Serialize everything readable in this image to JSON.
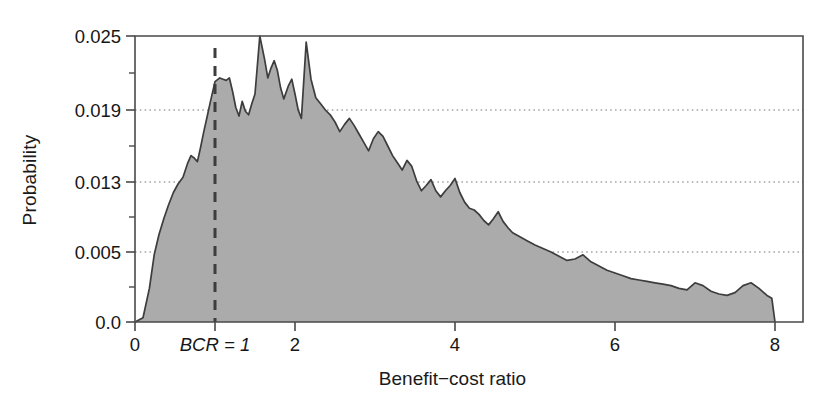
{
  "chart_data": {
    "type": "area",
    "title": "",
    "xlabel": "Benefit−cost ratio",
    "ylabel": "Probability",
    "xlim": [
      0,
      8.35
    ],
    "ylim": [
      0,
      0.0259
    ],
    "grid": "horizontal-dotted",
    "legend": "none",
    "fill_color": "#ababab",
    "line_color": "#3d3d3d",
    "xticks": [
      0,
      1,
      2,
      4,
      6,
      8
    ],
    "xticklabels": [
      "0",
      "BCR = 1",
      "2",
      "4",
      "6",
      "8"
    ],
    "yticks": [
      0.0,
      0.005,
      0.013,
      0.019,
      0.025
    ],
    "yticklabels": [
      "0.0",
      "0.005",
      "0.013",
      "0.019",
      "0.025"
    ],
    "yticks_minor": [
      0.0025,
      0.009,
      0.016,
      0.022
    ],
    "gridlines": [
      0.005,
      0.013,
      0.019
    ],
    "annotations": [
      {
        "name": "bcr-reference-line",
        "label": "BCR = 1",
        "x": 1.0,
        "style": "dashed-vertical",
        "color": "#3d3d3d"
      }
    ],
    "series": [
      {
        "name": "Benefit-cost ratio probability density",
        "x": [
          0.0,
          0.1,
          0.18,
          0.24,
          0.3,
          0.36,
          0.42,
          0.48,
          0.54,
          0.6,
          0.66,
          0.7,
          0.74,
          0.78,
          0.82,
          0.86,
          0.9,
          0.94,
          1.0,
          1.06,
          1.1,
          1.14,
          1.18,
          1.22,
          1.26,
          1.3,
          1.34,
          1.38,
          1.42,
          1.46,
          1.5,
          1.56,
          1.62,
          1.66,
          1.7,
          1.74,
          1.78,
          1.82,
          1.86,
          1.92,
          1.96,
          2.0,
          2.04,
          2.08,
          2.14,
          2.2,
          2.26,
          2.32,
          2.38,
          2.44,
          2.5,
          2.56,
          2.62,
          2.68,
          2.74,
          2.8,
          2.86,
          2.92,
          2.98,
          3.04,
          3.1,
          3.16,
          3.22,
          3.28,
          3.34,
          3.4,
          3.46,
          3.52,
          3.58,
          3.64,
          3.7,
          3.76,
          3.82,
          3.88,
          3.94,
          4.0,
          4.06,
          4.12,
          4.18,
          4.24,
          4.3,
          4.36,
          4.42,
          4.48,
          4.54,
          4.6,
          4.66,
          4.72,
          4.8,
          4.9,
          5.0,
          5.1,
          5.2,
          5.3,
          5.4,
          5.5,
          5.6,
          5.7,
          5.8,
          5.9,
          6.0,
          6.1,
          6.2,
          6.3,
          6.4,
          6.5,
          6.6,
          6.7,
          6.8,
          6.9,
          7.0,
          7.1,
          7.2,
          7.3,
          7.4,
          7.5,
          7.6,
          7.7,
          7.8,
          7.9,
          7.96,
          8.0
        ],
        "y": [
          0.0,
          0.0003,
          0.0024,
          0.0048,
          0.007,
          0.0088,
          0.0104,
          0.0118,
          0.0128,
          0.0134,
          0.0146,
          0.0152,
          0.015,
          0.0147,
          0.0159,
          0.0172,
          0.0184,
          0.0196,
          0.0213,
          0.0216,
          0.0215,
          0.0214,
          0.0216,
          0.0205,
          0.0192,
          0.0185,
          0.0197,
          0.0189,
          0.0186,
          0.0195,
          0.0203,
          0.025,
          0.0231,
          0.0216,
          0.0224,
          0.023,
          0.0222,
          0.0208,
          0.0199,
          0.021,
          0.0215,
          0.0203,
          0.019,
          0.0183,
          0.0245,
          0.0215,
          0.02,
          0.0195,
          0.019,
          0.0186,
          0.018,
          0.0172,
          0.0178,
          0.0183,
          0.0177,
          0.017,
          0.0163,
          0.0156,
          0.0166,
          0.0172,
          0.0168,
          0.016,
          0.0152,
          0.0146,
          0.014,
          0.0148,
          0.0143,
          0.0131,
          0.012,
          0.0126,
          0.0132,
          0.012,
          0.0113,
          0.012,
          0.0126,
          0.0133,
          0.0118,
          0.0107,
          0.01,
          0.0098,
          0.0093,
          0.0086,
          0.0081,
          0.0088,
          0.0096,
          0.0085,
          0.0078,
          0.0072,
          0.0068,
          0.0063,
          0.0058,
          0.0054,
          0.005,
          0.0047,
          0.0044,
          0.0045,
          0.0048,
          0.0043,
          0.004,
          0.0037,
          0.0035,
          0.0033,
          0.0031,
          0.003,
          0.0029,
          0.0028,
          0.0027,
          0.0026,
          0.0024,
          0.0023,
          0.0028,
          0.0026,
          0.0022,
          0.002,
          0.0019,
          0.0021,
          0.0026,
          0.0028,
          0.0024,
          0.0019,
          0.0017,
          0.0
        ]
      }
    ]
  },
  "axes": {
    "ylabel_text": "Probability",
    "xlabel_text": "Benefit−cost ratio"
  }
}
